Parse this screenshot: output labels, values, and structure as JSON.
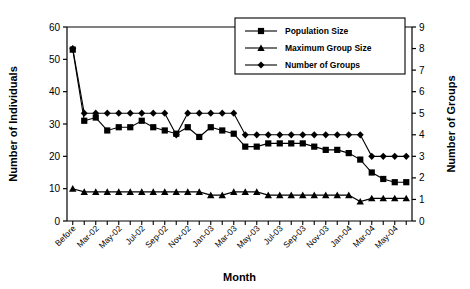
{
  "chart_data": {
    "type": "line",
    "title": "",
    "xlabel": "Month",
    "ylabel": "Number of Individuals",
    "y2label": "Number of Groups",
    "ylim": [
      0,
      60
    ],
    "y2lim": [
      0,
      9
    ],
    "yticks": [
      0,
      10,
      20,
      30,
      40,
      50,
      60
    ],
    "y2ticks": [
      0,
      1,
      2,
      3,
      4,
      5,
      6,
      7,
      8,
      9
    ],
    "grid": false,
    "legend_position": "top-right",
    "categories": [
      "Before",
      "Feb-02",
      "Mar-02",
      "Apr-02",
      "May-02",
      "Jun-02",
      "Jul-02",
      "Aug-02",
      "Sep-02",
      "Oct-02",
      "Nov-02",
      "Dec-02",
      "Jan-03",
      "Feb-03",
      "Mar-03",
      "Apr-03",
      "May-03",
      "Jun-03",
      "Jul-03",
      "Aug-03",
      "Sep-03",
      "Oct-03",
      "Nov-03",
      "Dec-03",
      "Jan-04",
      "Feb-04",
      "Mar-04",
      "Apr-04",
      "May-04",
      "Jun-04"
    ],
    "tick_labels": [
      "Before",
      "",
      "Mar-02",
      "",
      "May-02",
      "",
      "Jul-02",
      "",
      "Sep-02",
      "",
      "Nov-02",
      "",
      "Jan-03",
      "",
      "Mar-03",
      "",
      "May-03",
      "",
      "Jul-03",
      "",
      "Sep-03",
      "",
      "Nov-03",
      "",
      "Jan-04",
      "",
      "Mar-04",
      "",
      "May-04",
      ""
    ],
    "visible_tick_labels": [
      "Before",
      "Mar-02",
      "May-02",
      "Jul-02",
      "Sep-02",
      "Nov-02",
      "Jan-03",
      "Mar-03",
      "May-03",
      "Jul-03",
      "Sep-03",
      "Nov-03",
      "Jan-04",
      "Mar-04",
      "May-04"
    ],
    "series": [
      {
        "name": "Population Size",
        "axis": "left",
        "marker": "square",
        "color": "#000000",
        "values": [
          53,
          31,
          32,
          28,
          29,
          29,
          31,
          29,
          28,
          27,
          29,
          26,
          29,
          28,
          27,
          23,
          23,
          24,
          24,
          24,
          24,
          23,
          22,
          22,
          21,
          19,
          15,
          13,
          12,
          12
        ]
      },
      {
        "name": "Maximum Group Size",
        "axis": "left",
        "marker": "triangle",
        "color": "#000000",
        "values": [
          10,
          9,
          9,
          9,
          9,
          9,
          9,
          9,
          9,
          9,
          9,
          9,
          8,
          8,
          9,
          9,
          9,
          8,
          8,
          8,
          8,
          8,
          8,
          8,
          8,
          6,
          7,
          7,
          7,
          7
        ]
      },
      {
        "name": "Number of Groups",
        "axis": "right",
        "marker": "diamond",
        "color": "#000000",
        "values": [
          8,
          5,
          5,
          5,
          5,
          5,
          5,
          5,
          5,
          4,
          5,
          5,
          5,
          5,
          5,
          4,
          4,
          4,
          4,
          4,
          4,
          4,
          4,
          4,
          4,
          4,
          3,
          3,
          3,
          3
        ]
      }
    ]
  },
  "legend": {
    "entries": [
      {
        "label": "Population Size",
        "marker": "square"
      },
      {
        "label": "Maximum Group Size",
        "marker": "triangle"
      },
      {
        "label": "Number of Groups",
        "marker": "diamond"
      }
    ]
  },
  "axes": {
    "left_title": "Number of Individuals",
    "right_title": "Number of Groups",
    "x_title": "Month"
  }
}
